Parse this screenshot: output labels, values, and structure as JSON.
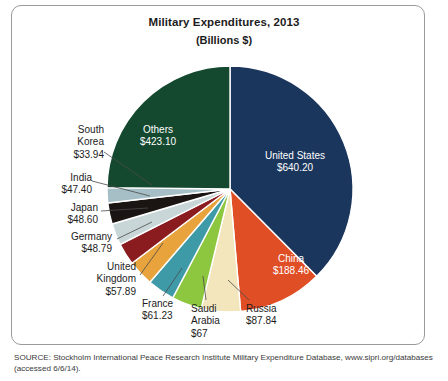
{
  "figure": {
    "title": "Military Expenditures, 2013",
    "subtitle": "(Billions $)",
    "source_line1": "SOURCE: Stockholm International Peace Research Institute Military Expenditure Database, www.sipri.org/databases",
    "source_line2": "(accessed 6/6/14)."
  },
  "chart_data": {
    "type": "pie",
    "title": "Military Expenditures, 2013",
    "subtitle": "(Billions $)",
    "units": "Billions of US dollars",
    "start_angle_deg": 0,
    "direction": "clockwise",
    "total": 1656.05,
    "legend": "none-labels-on-chart",
    "categories": [
      "United States",
      "China",
      "Russia",
      "Saudi Arabia",
      "France",
      "United Kingdom",
      "Germany",
      "Japan",
      "India",
      "South Korea",
      "Others"
    ],
    "values": [
      640.2,
      188.46,
      87.84,
      67,
      61.23,
      57.89,
      48.79,
      48.6,
      47.4,
      33.94,
      423.1
    ],
    "value_labels": [
      "$640.20",
      "$188.46",
      "$87.84",
      "$67",
      "$61.23",
      "$57.89",
      "$48.79",
      "$48.60",
      "$47.40",
      "$33.94",
      "$423.10"
    ],
    "colors": [
      "#1b365d",
      "#e04e26",
      "#f3e6bd",
      "#8dc63f",
      "#3f9aa8",
      "#e8a33d",
      "#8a1c20",
      "#c9d6d8",
      "#1a1412",
      "#a6bfc6",
      "#14492f"
    ],
    "slices": [
      {
        "name": "United States",
        "value": 640.2,
        "value_label": "$640.20",
        "color": "#1b365d"
      },
      {
        "name": "China",
        "value": 188.46,
        "value_label": "$188.46",
        "color": "#e04e26"
      },
      {
        "name": "Russia",
        "value": 87.84,
        "value_label": "$87.84",
        "color": "#f3e6bd"
      },
      {
        "name": "Saudi Arabia",
        "value": 67,
        "value_label": "$67",
        "color": "#8dc63f"
      },
      {
        "name": "France",
        "value": 61.23,
        "value_label": "$61.23",
        "color": "#3f9aa8"
      },
      {
        "name": "United Kingdom",
        "value": 57.89,
        "value_label": "$57.89",
        "color": "#e8a33d"
      },
      {
        "name": "Germany",
        "value": 48.79,
        "value_label": "$48.79",
        "color": "#8a1c20"
      },
      {
        "name": "Japan",
        "value": 48.6,
        "value_label": "$48.60",
        "color": "#c9d6d8"
      },
      {
        "name": "India",
        "value": 47.4,
        "value_label": "$47.40",
        "color": "#1a1412"
      },
      {
        "name": "South Korea",
        "value": 33.94,
        "value_label": "$33.94",
        "color": "#a6bfc6"
      },
      {
        "name": "Others",
        "value": 423.1,
        "value_label": "$423.10",
        "color": "#14492f"
      }
    ]
  },
  "labels": {
    "united_states": {
      "name": "United States",
      "value": "$640.20"
    },
    "china": {
      "name": "China",
      "value": "$188.46"
    },
    "russia": {
      "name": "Russia",
      "value": "$87.84"
    },
    "saudi_arabia": {
      "name": "Saudi",
      "name2": "Arabia",
      "value": "$67"
    },
    "france": {
      "name": "France",
      "value": "$61.23"
    },
    "united_kingdom": {
      "name": "United",
      "name2": "Kingdom",
      "value": "$57.89"
    },
    "germany": {
      "name": "Germany",
      "value": "$48.79"
    },
    "japan": {
      "name": "Japan",
      "value": "$48.60"
    },
    "india": {
      "name": "India",
      "value": "$47.40"
    },
    "south_korea": {
      "name": "South",
      "name2": "Korea",
      "value": "$33.94"
    },
    "others": {
      "name": "Others",
      "value": "$423.10"
    }
  }
}
